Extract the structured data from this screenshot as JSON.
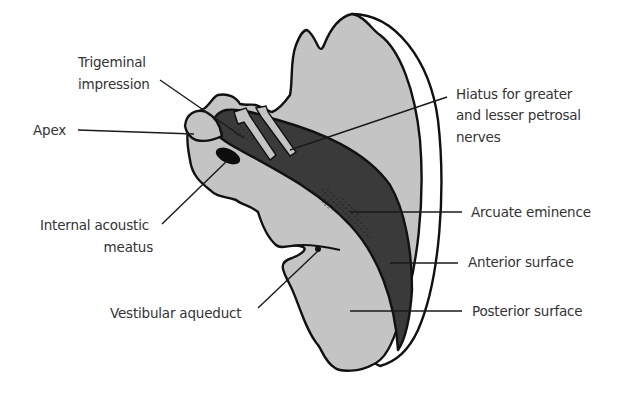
{
  "diagram": {
    "colors": {
      "background": "#ffffff",
      "bone_light": "#c4c4c4",
      "bone_dark": "#3a3a3a",
      "outline": "#111111",
      "label_text": "#333333"
    },
    "labels": {
      "trigeminal_1": "Trigeminal",
      "trigeminal_2": "impression",
      "apex": "Apex",
      "internal_acoustic_1": "Internal acoustic",
      "internal_acoustic_2": "meatus",
      "vestibular": "Vestibular aqueduct",
      "hiatus_1": "Hiatus for greater",
      "hiatus_2": "and lesser petrosal",
      "hiatus_3": "nerves",
      "arcuate": "Arcuate eminence",
      "anterior": "Anterior surface",
      "posterior": "Posterior surface"
    }
  }
}
